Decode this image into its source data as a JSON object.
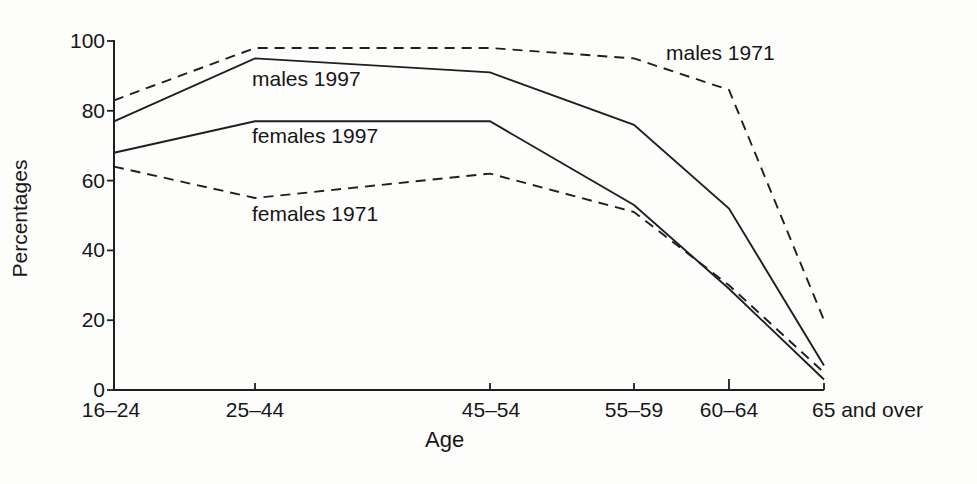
{
  "figure": {
    "background_color": "#fdfdfc",
    "line_color": "#1f1f1f",
    "text_color": "#161616"
  },
  "chart_data": {
    "type": "line",
    "title": "",
    "xlabel": "Age",
    "ylabel": "Percentages",
    "categories": [
      "16–24",
      "25–44",
      "45–54",
      "55–59",
      "60–64",
      "65 and over"
    ],
    "y_ticks": [
      100,
      80,
      60,
      40,
      20,
      0
    ],
    "ylim": [
      0,
      100
    ],
    "grid": false,
    "legend_position": "inline-annotations",
    "series": [
      {
        "label": "males 1971",
        "style": "dashed",
        "values": [
          83,
          98,
          98,
          95,
          86,
          20
        ]
      },
      {
        "label": "males 1997",
        "style": "solid",
        "values": [
          77,
          95,
          91,
          76,
          52,
          7
        ]
      },
      {
        "label": "females 1997",
        "style": "solid",
        "values": [
          68,
          77,
          77,
          53,
          29,
          3
        ]
      },
      {
        "label": "females 1971",
        "style": "dashed",
        "values": [
          64,
          55,
          62,
          51,
          30,
          5
        ]
      }
    ]
  }
}
